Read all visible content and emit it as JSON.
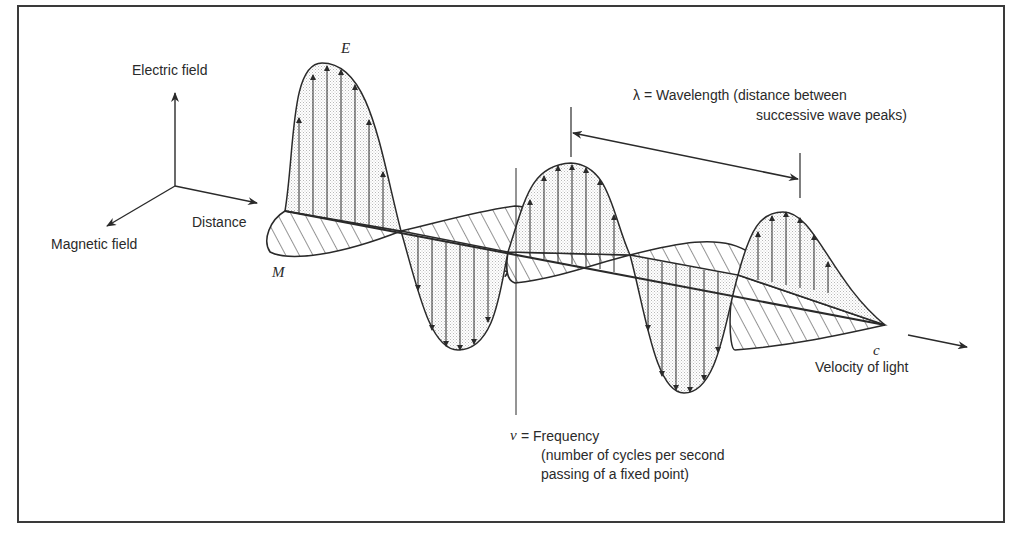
{
  "figure": {
    "type": "electromagnetic-wave-diagram",
    "axes_legend": {
      "electric_field": "Electric field",
      "magnetic_field": "Magnetic field",
      "distance": "Distance"
    },
    "wave_labels": {
      "electric_symbol": "E",
      "magnetic_symbol": "M",
      "velocity_symbol": "c",
      "velocity_label": "Velocity of light"
    },
    "wavelength": {
      "line1": "λ = Wavelength (distance between",
      "line2": "successive wave peaks)"
    },
    "frequency": {
      "symbol": "v",
      "line1": "= Frequency",
      "line2": "(number of cycles per second",
      "line3": "passing of a fixed point)"
    }
  },
  "colors": {
    "ink": "#2a2a2a",
    "frame": "#3a3a3a",
    "stipple": "#e4e4e4",
    "background": "#ffffff"
  }
}
